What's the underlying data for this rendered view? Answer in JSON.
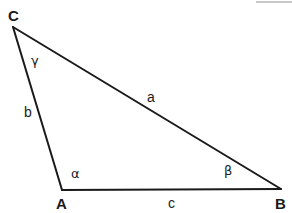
{
  "figure": {
    "kind": "triangle-diagram",
    "background_color": "#ffffff",
    "stroke_color": "#1a1a1a",
    "stroke_width": 2,
    "width": 292,
    "height": 213,
    "vertices": [
      {
        "id": "C",
        "label": "C",
        "x": 13,
        "y": 27,
        "label_x": 8,
        "label_y": 8
      },
      {
        "id": "A",
        "label": "A",
        "x": 62,
        "y": 190,
        "label_x": 56,
        "label_y": 196
      },
      {
        "id": "B",
        "label": "B",
        "x": 281,
        "y": 189,
        "label_x": 275,
        "label_y": 196
      }
    ],
    "sides": [
      {
        "id": "a",
        "label": "a",
        "from": "C",
        "to": "B",
        "label_x": 147,
        "label_y": 90
      },
      {
        "id": "b",
        "label": "b",
        "from": "C",
        "to": "A",
        "label_x": 24,
        "label_y": 105
      },
      {
        "id": "c",
        "label": "c",
        "from": "A",
        "to": "B",
        "label_x": 168,
        "label_y": 196
      }
    ],
    "angles": [
      {
        "id": "gamma",
        "label": "γ",
        "at": "C",
        "label_x": 31,
        "label_y": 54
      },
      {
        "id": "alpha",
        "label": "α",
        "at": "A",
        "label_x": 71,
        "label_y": 167
      },
      {
        "id": "beta",
        "label": "β",
        "at": "B",
        "label_x": 224,
        "label_y": 164
      }
    ],
    "artifact": {
      "name": "top-edge-scan-artifact",
      "color": "#c9c9c9"
    }
  }
}
